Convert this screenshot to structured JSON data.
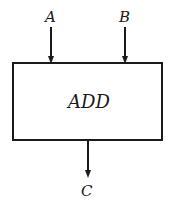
{
  "diagram": {
    "inputs": [
      {
        "label": "A"
      },
      {
        "label": "B"
      }
    ],
    "block": {
      "label": "ADD"
    },
    "output": {
      "label": "C"
    },
    "colors": {
      "stroke": "#1a1a1a",
      "background": "#ffffff"
    }
  }
}
